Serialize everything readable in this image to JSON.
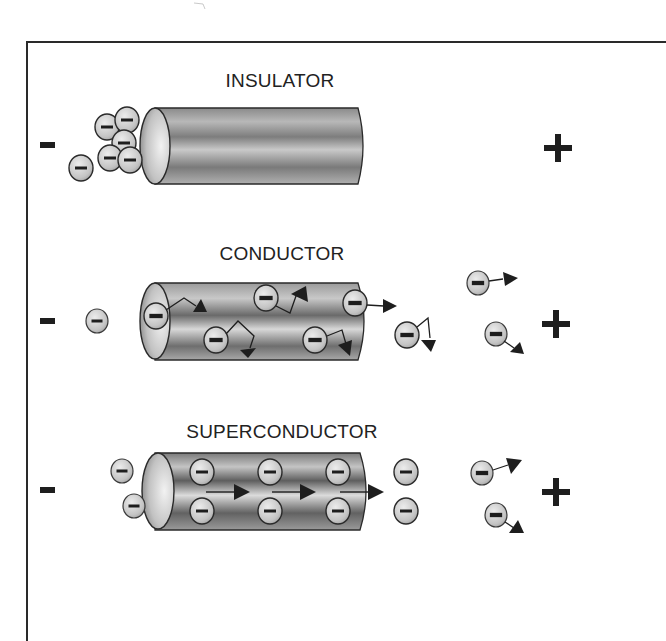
{
  "panels": [
    {
      "id": "insulator",
      "title": "INSULATOR",
      "negative_terminal": "-",
      "positive_terminal": "+",
      "description": "Electrons pile up at entrance; none pass through"
    },
    {
      "id": "conductor",
      "title": "CONDUCTOR",
      "negative_terminal": "-",
      "positive_terminal": "+",
      "description": "Electrons scatter along zigzag paths through material"
    },
    {
      "id": "superconductor",
      "title": "SUPERCONDUCTOR",
      "negative_terminal": "-",
      "positive_terminal": "+",
      "description": "Electrons flow in straight paths with no resistance"
    }
  ],
  "colors": {
    "frame": "#2a2a2a",
    "ink": "#1e1e1e",
    "electron_fill": "#c8c8c8",
    "cylinder_dark": "#6e6e6e",
    "cylinder_light": "#d9d9d9"
  },
  "electron_symbol": "-"
}
